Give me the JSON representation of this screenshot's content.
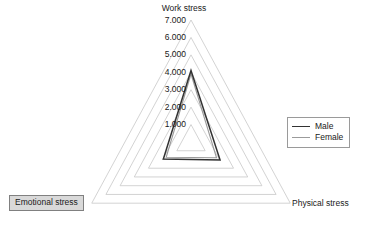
{
  "chart_data": {
    "type": "radar",
    "title": "",
    "axes": [
      "Work stress",
      "Physical stress",
      "Emotional stress"
    ],
    "tick_labels": [
      "1.000",
      "2.000",
      "3.000",
      "4.000",
      "5.000",
      "6.000",
      "7.000"
    ],
    "ticks": [
      1,
      2,
      3,
      4,
      5,
      6,
      7
    ],
    "rlim": [
      0,
      7
    ],
    "grid": true,
    "legend_position": "right",
    "series": [
      {
        "name": "Male",
        "color": "#333333",
        "values": [
          4.1,
          2.05,
          1.95
        ]
      },
      {
        "name": "Female",
        "color": "#9b9b9b",
        "values": [
          3.9,
          1.8,
          1.75
        ]
      }
    ],
    "categories": [
      "Work stress",
      "Physical stress",
      "Emotional stress"
    ]
  },
  "axis_titles": {
    "work": "Work stress",
    "physical": "Physical stress",
    "emotional": "Emotional stress"
  },
  "legend": {
    "items": [
      {
        "label": "Male"
      },
      {
        "label": "Female"
      }
    ]
  },
  "style": {
    "grid_color": "#c8c8c8",
    "male_color": "#333333",
    "female_color": "#9b9b9b",
    "selected_fill": "#d9d9d9",
    "selected_border": "#808080",
    "background": "#ffffff"
  }
}
